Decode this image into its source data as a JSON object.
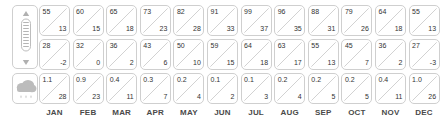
{
  "table": {
    "months": [
      "JAN",
      "FEB",
      "MAR",
      "APR",
      "MAY",
      "JUN",
      "JUL",
      "AUG",
      "SEP",
      "OCT",
      "NOV",
      "DEC"
    ],
    "rows": [
      {
        "id": "high-temperature",
        "icon": "thermometer-icon",
        "unit_top": "°F",
        "unit_bottom": "°C",
        "top": [
          "55",
          "60",
          "65",
          "73",
          "82",
          "91",
          "99",
          "96",
          "88",
          "79",
          "64",
          "55"
        ],
        "bottom": [
          "13",
          "15",
          "18",
          "23",
          "28",
          "33",
          "37",
          "35",
          "31",
          "26",
          "18",
          "13"
        ]
      },
      {
        "id": "low-temperature",
        "icon": "thermometer-icon",
        "unit_top": "°F",
        "unit_bottom": "°C",
        "top": [
          "28",
          "32",
          "36",
          "43",
          "50",
          "59",
          "64",
          "63",
          "55",
          "45",
          "36",
          "27"
        ],
        "bottom": [
          "-2",
          "0",
          "2",
          "6",
          "10",
          "15",
          "18",
          "17",
          "13",
          "7",
          "2",
          "-3"
        ]
      },
      {
        "id": "precipitation",
        "icon": "rain-cloud-icon",
        "unit_top": "in",
        "unit_bottom": "mm",
        "top": [
          "1.1",
          "0.9",
          "0.4",
          "0.3",
          "0.2",
          "0.1",
          "0.1",
          "0.2",
          "0.2",
          "0.2",
          "0.4",
          "1.0"
        ],
        "bottom": [
          "28",
          "23",
          "11",
          "7",
          "4",
          "2",
          "3",
          "4",
          "5",
          "5",
          "11",
          "26"
        ]
      }
    ]
  },
  "colors": {
    "border": "#cfcfcf",
    "text": "#333333",
    "month_label": "#4a4a4a",
    "icon": "#b5b5b5",
    "background": "#ffffff"
  }
}
